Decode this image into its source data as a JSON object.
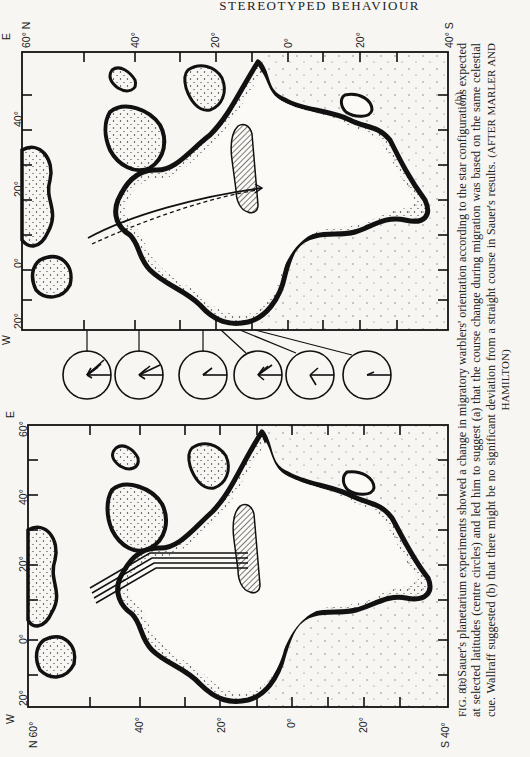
{
  "header": {
    "running_title": "STEREOTYPED BEHAVIOUR"
  },
  "figure": {
    "number": "FIG. 81",
    "caption_lead": "FIG. 81:",
    "caption_text": "Sauer's planetarium experiments showed a change in migratory warblers' orientation according to the star configurations expected at selected latitudes (centre circles) and led him to suggest (a) that the course change during migration was based on the same celestial cue. Wallraff suggested (b) that there might be no significant deviation from a straight course in Sauer's results.",
    "caption_credit": "(AFTER MARLER AND HAMILTON)",
    "panels": [
      {
        "id": "b",
        "label": "(b)",
        "lat_labels": [
          "60° N",
          "40°",
          "20°",
          "0°",
          "20°",
          "40° S"
        ],
        "lon_labels": [
          "20°",
          "0°",
          "20°",
          "40°",
          "60°"
        ],
        "compass_west": "W",
        "compass_east": "E",
        "route_style": "curved solid and dashed great-circle lines"
      },
      {
        "id": "a",
        "label": "(a)",
        "lat_labels": [
          "N 60°",
          "40°",
          "20°",
          "0°",
          "20°",
          "S 40°"
        ],
        "lon_labels": [
          "20°",
          "0°",
          "20°",
          "40°",
          "60°"
        ],
        "compass_west": "W",
        "compass_east": "E",
        "route_style": "parallel lines with bend"
      }
    ],
    "orientation_circles": {
      "count": 6,
      "description": "centre circles showing orientation at selected latitudes"
    }
  }
}
